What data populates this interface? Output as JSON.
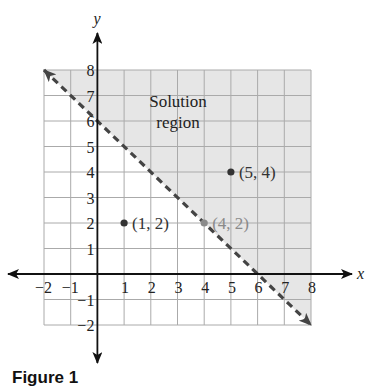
{
  "chart_data": {
    "type": "scatter",
    "title": "",
    "xlabel": "x",
    "ylabel": "y",
    "xlim": [
      -2,
      8
    ],
    "ylim": [
      -2,
      8
    ],
    "grid": true,
    "x_ticks": [
      -2,
      -1,
      1,
      2,
      3,
      4,
      5,
      6,
      7,
      8
    ],
    "y_ticks": [
      -2,
      -1,
      1,
      2,
      3,
      4,
      5,
      6,
      7,
      8
    ],
    "boundary_line": {
      "equation": "x + y = 6",
      "style": "dashed",
      "from": [
        -2,
        8
      ],
      "to": [
        8,
        -2
      ],
      "arrows": "both"
    },
    "shaded_region": {
      "label": "Solution region",
      "label_lines": [
        "Solution",
        "region"
      ],
      "description": "area above the dashed line (x + y > 6)",
      "color": "#e6e6e6"
    },
    "points": [
      {
        "x": 1,
        "y": 2,
        "label": "(1, 2)",
        "color": "#333333"
      },
      {
        "x": 4,
        "y": 2,
        "label": "(4, 2)",
        "color": "#8a8a8a"
      },
      {
        "x": 5,
        "y": 4,
        "label": "(5, 4)",
        "color": "#333333"
      }
    ],
    "caption": "Figure 1"
  },
  "colors": {
    "axis": "#111111",
    "grid": "#aaaaaa",
    "shade": "#e6e6e6",
    "dashed_line": "#444444",
    "text": "#222222",
    "muted_point": "#8a8a8a"
  }
}
